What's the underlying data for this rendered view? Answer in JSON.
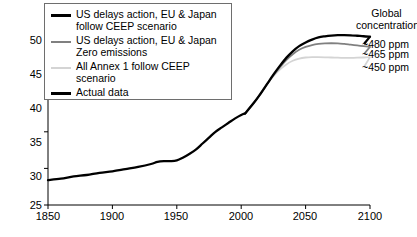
{
  "chart_data": {
    "type": "line",
    "title": "",
    "xlabel": "",
    "ylabel": "",
    "xlim": [
      1850,
      2100
    ],
    "ylim": [
      25,
      50
    ],
    "grid": false,
    "legend_position": "top-left",
    "xticks": [
      1850,
      1900,
      1950,
      2000,
      2050,
      2100
    ],
    "yticks": [
      25,
      30,
      35,
      40,
      45,
      50
    ],
    "series": [
      {
        "name": "Actual data",
        "color": "#000000",
        "x": [
          1850,
          1860,
          1870,
          1880,
          1890,
          1900,
          1910,
          1920,
          1930,
          1935,
          1940,
          1945,
          1950,
          1955,
          1960,
          1965,
          1970,
          1975,
          1980,
          1985,
          1990,
          1995,
          2000,
          2003
        ],
        "values": [
          28.4,
          28.6,
          28.9,
          29.1,
          29.4,
          29.6,
          29.9,
          30.2,
          30.6,
          30.9,
          31.0,
          31.0,
          31.1,
          31.5,
          32.0,
          32.6,
          33.4,
          34.2,
          35.0,
          35.6,
          36.2,
          36.8,
          37.3,
          37.5
        ]
      },
      {
        "name": "US delays action, EU & Japan follow CEEP scenario",
        "color": "#000000",
        "endpoint_label": "~480 ppm",
        "x": [
          2003,
          2010,
          2015,
          2020,
          2025,
          2030,
          2035,
          2040,
          2045,
          2050,
          2055,
          2060,
          2065,
          2070,
          2075,
          2080,
          2085,
          2090,
          2095,
          2100
        ],
        "values": [
          37.5,
          39.0,
          40.2,
          41.5,
          42.8,
          44.0,
          45.1,
          46.0,
          46.7,
          47.2,
          47.6,
          47.9,
          48.05,
          48.15,
          48.2,
          48.2,
          48.18,
          48.12,
          48.05,
          48.0
        ]
      },
      {
        "name": "US delays action, EU & Japan Zero emissions",
        "color": "#808080",
        "endpoint_label": "~465 ppm",
        "x": [
          2003,
          2010,
          2015,
          2020,
          2025,
          2030,
          2035,
          2040,
          2045,
          2050,
          2055,
          2060,
          2065,
          2070,
          2075,
          2080,
          2085,
          2090,
          2095,
          2100
        ],
        "values": [
          37.5,
          39.0,
          40.2,
          41.5,
          42.7,
          43.8,
          44.8,
          45.6,
          46.2,
          46.6,
          46.85,
          47.0,
          47.08,
          47.1,
          47.08,
          47.0,
          46.9,
          46.8,
          46.7,
          46.6
        ]
      },
      {
        "name": "All Annex 1 follow CEEP scenario",
        "color": "#d4d4d4",
        "endpoint_label": "~450 ppm",
        "x": [
          2003,
          2010,
          2015,
          2020,
          2025,
          2030,
          2035,
          2040,
          2045,
          2050,
          2055,
          2060,
          2065,
          2070,
          2075,
          2080,
          2085,
          2090,
          2095,
          2100
        ],
        "values": [
          37.5,
          39.0,
          40.2,
          41.5,
          42.6,
          43.5,
          44.2,
          44.7,
          45.0,
          45.15,
          45.2,
          45.2,
          45.18,
          45.15,
          45.12,
          45.1,
          45.1,
          45.12,
          45.15,
          45.2
        ]
      }
    ]
  },
  "legend": {
    "items": [
      {
        "label": "US delays action, EU & Japan\nfollow CEEP scenario",
        "swatch": "black"
      },
      {
        "label": "US delays action, EU & Japan\nZero emissions",
        "swatch": "gray"
      },
      {
        "label": "All Annex 1 follow CEEP scenario",
        "swatch": "light"
      },
      {
        "label": "Actual data",
        "swatch": "black"
      }
    ]
  },
  "right_annotations": {
    "title": "Global\nconcentration",
    "items": [
      {
        "label": "~480 ppm"
      },
      {
        "label": "~465 ppm"
      },
      {
        "label": "~450 ppm"
      }
    ]
  },
  "axes": {
    "y_tick_labels": [
      "50",
      "45",
      "40",
      "35",
      "30",
      "25"
    ],
    "x_tick_labels": [
      "1850",
      "1900",
      "1950",
      "2000",
      "2050",
      "2100"
    ]
  }
}
